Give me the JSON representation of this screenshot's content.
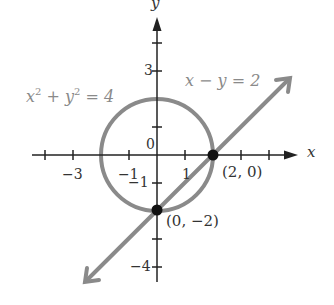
{
  "figure": {
    "axes": {
      "x_label": "x",
      "y_label": "y",
      "x_ticks": [
        -4,
        -3,
        -2,
        -1,
        1,
        2,
        3,
        4
      ],
      "y_ticks": [
        4,
        3,
        2,
        1,
        -1,
        -2,
        -3,
        -4
      ],
      "labeled_x_ticks": {
        "neg3": "−3",
        "neg1": "−1",
        "pos1": "1"
      },
      "labeled_y_ticks": {
        "pos3": "3",
        "neg1": "−1",
        "neg4": "−4"
      },
      "origin_label": "0"
    },
    "curves": {
      "circle": {
        "equation_x": "x",
        "equation_y": "y",
        "sup": "2",
        "equation_rest": " = 4",
        "plus": " + ",
        "radius": 2,
        "color": "#8a8a8a"
      },
      "line": {
        "equation": "x − y = 2",
        "color": "#8a8a8a"
      }
    },
    "points": [
      {
        "label": "(2, 0)",
        "x": 2,
        "y": 0
      },
      {
        "label": "(0, −2)",
        "x": 0,
        "y": -2
      }
    ]
  }
}
